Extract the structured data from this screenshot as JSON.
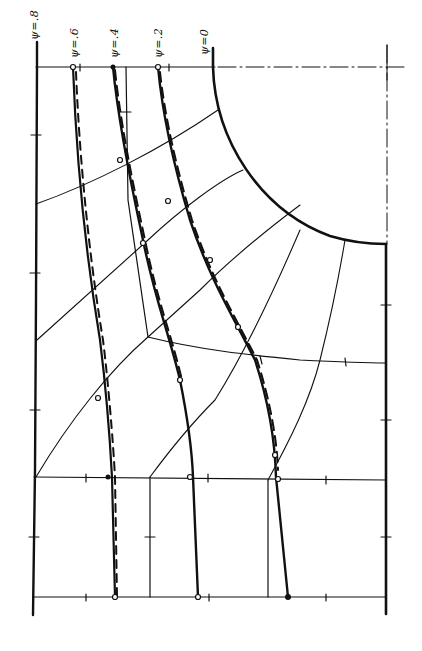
{
  "diagram": {
    "type": "flow-net",
    "orientation": "rotated 90 degrees",
    "stream_line_labels": [
      {
        "id": "psi-08",
        "text": "ψ=.8",
        "x": 22,
        "y": 72
      },
      {
        "id": "psi-06",
        "text": "ψ=.6",
        "x": 65,
        "y": 62
      },
      {
        "id": "psi-04",
        "text": "ψ=.4",
        "x": 107,
        "y": 62
      },
      {
        "id": "psi-02",
        "text": "ψ=.2",
        "x": 150,
        "y": 62
      },
      {
        "id": "psi-00",
        "text": "ψ=0",
        "x": 195,
        "y": 60
      }
    ],
    "colors": {
      "line": "#111111",
      "background": "#ffffff"
    }
  }
}
